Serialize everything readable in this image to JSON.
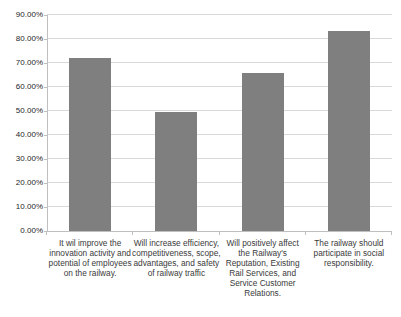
{
  "chart_data": {
    "type": "bar",
    "title": "",
    "xlabel": "",
    "ylabel": "",
    "categories": [
      "It wil improve the\ninnovation activity and\npotential of employees\non the railway.",
      "Will increase efficiency,\ncompetitiveness, scope,\nadvantages, and safety\nof railway traffic",
      "Will positively affect\nthe Railway's\nReputation, Existing\nRail Services, and\nService Customer\nRelations.",
      "The railway should\nparticipate in social\nresponsibility."
    ],
    "values": [
      72,
      49.5,
      66,
      83.5
    ],
    "ylim": [
      0,
      90
    ],
    "y_tick_labels": [
      "0.00%",
      "10.00%",
      "20.00%",
      "30.00%",
      "40.00%",
      "50.00%",
      "60.00%",
      "70.00%",
      "80.00%",
      "90.00%"
    ],
    "grid": true,
    "legend_position": "none",
    "bar_color": "#7f7f7f",
    "gridline_color": "#d9d9d9",
    "axis_color": "#bfbfbf",
    "tick_label_color": "#262626",
    "category_label_color": "#3a3a3a"
  }
}
